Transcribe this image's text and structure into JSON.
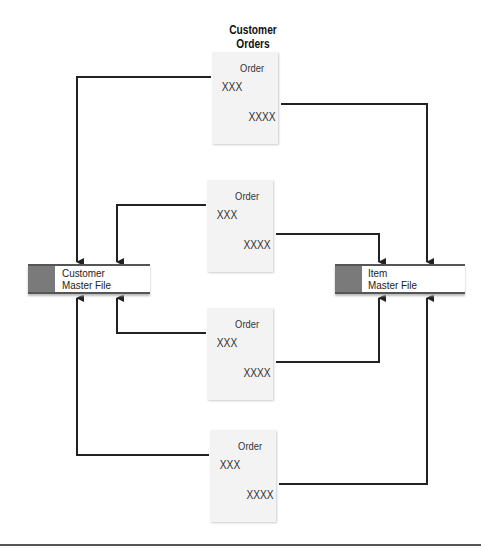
{
  "title": "Customer\nOrders",
  "title_lines": [
    "Customer",
    "Orders"
  ],
  "orders": [
    {
      "label": "Order",
      "line1": "XXX",
      "line2": "XXXX"
    },
    {
      "label": "Order",
      "line1": "XXX",
      "line2": "XXXX"
    },
    {
      "label": "Order",
      "line1": "XXX",
      "line2": "XXXX"
    },
    {
      "label": "Order",
      "line1": "XXX",
      "line2": "XXXX"
    }
  ],
  "stores": {
    "customer": {
      "line1": "Customer",
      "line2": "Master File"
    },
    "item": {
      "line1": "Item",
      "line2": "Master File"
    }
  },
  "colors": {
    "line": "#222222",
    "store_block": "#7a7a7a",
    "doc_fill": "#f3f3f3"
  }
}
